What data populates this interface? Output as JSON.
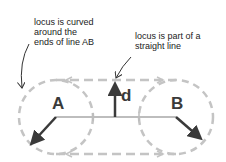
{
  "annotations": {
    "left": "locus is curved\naround the\nends of line AB",
    "right": "locus is part of a\nstraight line"
  },
  "labels": {
    "point_a": "A",
    "point_b": "B",
    "distance": "d"
  },
  "colors": {
    "dashed_locus": "#c4c4c4",
    "line_ab": "#bdbdbd",
    "arrows": "#3a3a3a",
    "text": "#222222"
  }
}
